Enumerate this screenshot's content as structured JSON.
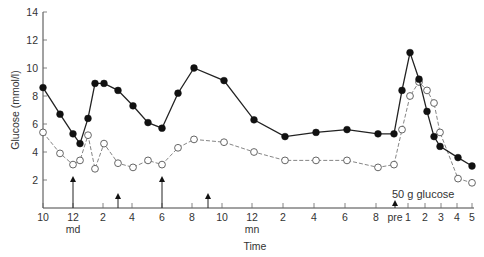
{
  "chart_data": {
    "type": "line",
    "title": "",
    "xlabel": "Time",
    "ylabel": "Glucose (mmol/l)",
    "ylim": [
      0,
      14
    ],
    "yticks": [
      2,
      4,
      6,
      8,
      10,
      12,
      14
    ],
    "grid": false,
    "legend": null,
    "x_tick_labels": [
      {
        "label": "10",
        "sub": "",
        "px": 43
      },
      {
        "label": "12",
        "sub": "md",
        "px": 73
      },
      {
        "label": "2",
        "sub": "",
        "px": 103
      },
      {
        "label": "4",
        "sub": "",
        "px": 132
      },
      {
        "label": "6",
        "sub": "",
        "px": 162
      },
      {
        "label": "8",
        "sub": "",
        "px": 192
      },
      {
        "label": "10",
        "sub": "",
        "px": 222
      },
      {
        "label": "12",
        "sub": "mn",
        "px": 252
      },
      {
        "label": "2",
        "sub": "",
        "px": 283
      },
      {
        "label": "4",
        "sub": "",
        "px": 314
      },
      {
        "label": "6",
        "sub": "",
        "px": 345
      },
      {
        "label": "8",
        "sub": "",
        "px": 376
      },
      {
        "label": "pre",
        "sub": "",
        "px": 395
      },
      {
        "label": "1",
        "sub": "",
        "px": 408
      },
      {
        "label": "2",
        "sub": "",
        "px": 425
      },
      {
        "label": "3",
        "sub": "",
        "px": 441
      },
      {
        "label": "4",
        "sub": "",
        "px": 457
      },
      {
        "label": "5",
        "sub": "",
        "px": 472
      }
    ],
    "series": [
      {
        "name": "filled circles (solid line)",
        "marker": "filled-circle",
        "line": "solid",
        "color": "#1a1a1a",
        "x_px": [
          43,
          60,
          73,
          80,
          88,
          95,
          104,
          118,
          133,
          148,
          162,
          178,
          194,
          224,
          254,
          285,
          316,
          347,
          378,
          394,
          402,
          410,
          419,
          427,
          434,
          440,
          458,
          472
        ],
        "values": [
          8.6,
          6.7,
          5.3,
          4.6,
          6.4,
          8.9,
          8.9,
          8.4,
          7.3,
          6.1,
          5.7,
          8.2,
          10.0,
          9.1,
          6.3,
          5.1,
          5.4,
          5.6,
          5.3,
          5.3,
          8.4,
          11.1,
          9.2,
          6.9,
          5.1,
          4.4,
          3.6,
          3.0
        ]
      },
      {
        "name": "open circles (dashed line)",
        "marker": "open-circle",
        "line": "dashed",
        "color": "#555555",
        "x_px": [
          43,
          60,
          73,
          80,
          88,
          95,
          104,
          118,
          133,
          148,
          162,
          178,
          194,
          224,
          254,
          285,
          316,
          347,
          378,
          394,
          402,
          410,
          419,
          427,
          434,
          440,
          458,
          472
        ],
        "values": [
          5.4,
          3.9,
          3.1,
          3.4,
          5.2,
          2.8,
          4.6,
          3.2,
          2.9,
          3.4,
          3.1,
          4.3,
          4.9,
          4.7,
          4.0,
          3.4,
          3.4,
          3.4,
          2.9,
          3.1,
          5.6,
          8.0,
          9.0,
          8.4,
          7.5,
          5.4,
          2.1,
          1.8
        ]
      }
    ],
    "annotations": [
      {
        "type": "arrow",
        "x_px": 73,
        "height": "tall"
      },
      {
        "type": "arrow",
        "x_px": 118,
        "height": "short"
      },
      {
        "type": "arrow",
        "x_px": 162,
        "height": "tall"
      },
      {
        "type": "arrow",
        "x_px": 208,
        "height": "short"
      },
      {
        "type": "arrow",
        "x_px": 395,
        "height": "tiny"
      },
      {
        "type": "text",
        "text": "50 g glucose"
      }
    ]
  },
  "labels": {
    "ylabel": "Glucose (mmol/l)",
    "xlabel": "Time",
    "annotation": "50 g glucose",
    "md": "md",
    "mn": "mn"
  }
}
